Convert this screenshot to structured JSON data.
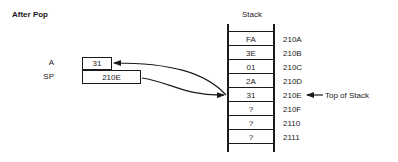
{
  "title": "After Pop",
  "registers": [
    {
      "name": "A",
      "value": "31"
    },
    {
      "name": "SP",
      "value": "210E"
    }
  ],
  "stack": {
    "label": "Stack",
    "cells": [
      {
        "value": "FA",
        "address": "210A"
      },
      {
        "value": "3E",
        "address": "210B"
      },
      {
        "value": "01",
        "address": "210C"
      },
      {
        "value": "2A",
        "address": "210D"
      },
      {
        "value": "31",
        "address": "210E"
      },
      {
        "value": "?",
        "address": "210F"
      },
      {
        "value": "?",
        "address": "2110"
      },
      {
        "value": "?",
        "address": "2111"
      }
    ]
  },
  "annotation": {
    "top_of_stack": "Top of Stack"
  },
  "arrows": [
    {
      "from": "stack.210E",
      "to": "register.A",
      "meaning": "popped value copied to A"
    },
    {
      "from": "register.SP",
      "to": "stack.210E",
      "meaning": "SP points to top of stack"
    },
    {
      "from": "annotation.top_of_stack",
      "to": "address.210E"
    }
  ]
}
